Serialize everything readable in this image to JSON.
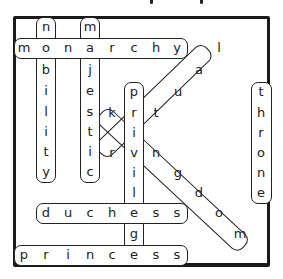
{
  "puzzle": {
    "type": "word-search",
    "title_fragment_visible": true,
    "found_words": [
      {
        "word": "monarchy",
        "direction": "horizontal"
      },
      {
        "word": "nobility",
        "direction": "vertical"
      },
      {
        "word": "majestic",
        "direction": "vertical"
      },
      {
        "word": "privilege",
        "direction": "vertical"
      },
      {
        "word": "ritual",
        "direction": "diagonal-up"
      },
      {
        "word": "kingdom",
        "direction": "diagonal-down"
      },
      {
        "word": "throne",
        "direction": "vertical"
      },
      {
        "word": "duchess",
        "direction": "horizontal"
      },
      {
        "word": "princess",
        "direction": "horizontal"
      }
    ],
    "letters": {
      "monarchy": [
        "m",
        "o",
        "n",
        "a",
        "r",
        "c",
        "h",
        "y"
      ],
      "nobility": [
        "n",
        "b",
        "i",
        "l",
        "i",
        "t",
        "y"
      ],
      "majestic": [
        "m",
        "j",
        "e",
        "s",
        "t",
        "i",
        "c"
      ],
      "privilege": [
        "p",
        "r",
        "i",
        "v",
        "i",
        "l",
        "e",
        "g",
        "e"
      ],
      "ritual": [
        "r",
        "t",
        "u",
        "a",
        "l"
      ],
      "kingdom": [
        "k",
        "n",
        "g",
        "d",
        "o",
        "m"
      ],
      "throne": [
        "t",
        "h",
        "r",
        "o",
        "n",
        "e"
      ],
      "duchess": [
        "d",
        "u",
        "c",
        "h",
        "e",
        "s",
        "s"
      ],
      "princess": [
        "p",
        "r",
        "i",
        "n",
        "c",
        "e",
        "s",
        "s"
      ]
    }
  }
}
